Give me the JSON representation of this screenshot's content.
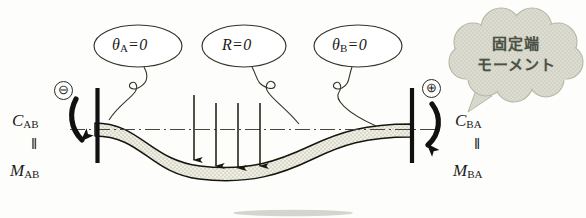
{
  "figure": {
    "colors": {
      "ink": "#1b1b1b",
      "beam_fill": "#ecebe0",
      "cloud_fill": "#d9dace",
      "cloud_text": "#4b5245",
      "centerline": "#4a4a42"
    }
  },
  "callouts": [
    {
      "id": "theta-a",
      "symbol": "θ",
      "subscript": "A",
      "equals": "=",
      "value": "0",
      "text": "θA=0"
    },
    {
      "id": "reaction",
      "symbol": "R",
      "subscript": "",
      "equals": "=",
      "value": "0",
      "text": "R=0"
    },
    {
      "id": "theta-b",
      "symbol": "θ",
      "subscript": "B",
      "equals": "=",
      "value": "0",
      "text": "θB=0"
    }
  ],
  "cloud": {
    "line1": "固定端",
    "line2": "モーメント"
  },
  "left_moment": {
    "sign": "⊖",
    "sign_name": "minus-circle",
    "symbol": "C",
    "subscript": "AB",
    "equals": "=",
    "symbol2": "M",
    "subscript2": "AB"
  },
  "right_moment": {
    "sign": "⊕",
    "sign_name": "plus-circle",
    "symbol": "C",
    "subscript": "BA",
    "equals": "=",
    "symbol2": "M",
    "subscript2": "BA"
  },
  "loads": {
    "count": 4,
    "direction": "down",
    "label": "distributed-point-loads"
  },
  "supports": {
    "left": "fixed-wall",
    "right": "fixed-wall"
  }
}
